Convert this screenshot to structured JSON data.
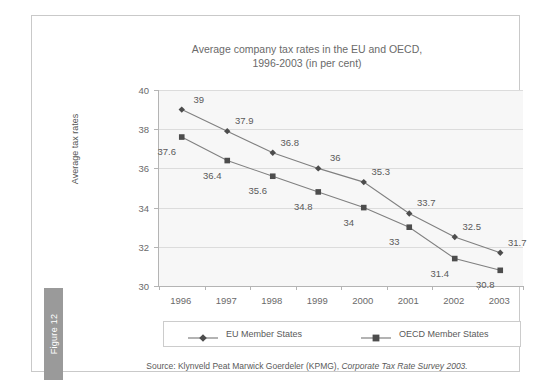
{
  "figure": {
    "tab_label": "Figure 12"
  },
  "source": {
    "prefix": "Source: Klynveld Peat Marwick Goerdeler (KPMG),",
    "italic": "Corporate Tax Rate Survey 2003."
  },
  "colors": {
    "line": "#808080",
    "marker": "#4d4d4d",
    "text": "#5a5a5a",
    "title_text": "#6a6a6a",
    "plot_background": "#f7f7f7",
    "gridline": "#dcdcdc",
    "axis": "#b4b4b4",
    "frame_border": "#c9c9c9",
    "tab_background": "#9a9a9a"
  },
  "chart_data": {
    "type": "line",
    "title": "Average company tax rates in the EU and OECD,",
    "subtitle": "1996-2003 (in per cent)",
    "xlabel": "",
    "ylabel": "Average tax rates",
    "categories": [
      "1996",
      "1997",
      "1998",
      "1999",
      "2000",
      "2001",
      "2002",
      "2003"
    ],
    "ylim": [
      30,
      40
    ],
    "yticks": [
      30,
      32,
      34,
      36,
      38,
      40
    ],
    "grid": true,
    "legend_position": "bottom",
    "series": [
      {
        "name": "EU Member States",
        "marker": "diamond",
        "values": [
          39,
          37.9,
          36.8,
          36,
          35.3,
          33.7,
          32.5,
          31.7
        ],
        "labels": [
          "39",
          "37.9",
          "36.8",
          "36",
          "35.3",
          "33.7",
          "32.5",
          "31.7"
        ]
      },
      {
        "name": "OECD Member States",
        "marker": "square",
        "values": [
          37.6,
          36.4,
          35.6,
          34.8,
          34,
          33,
          31.4,
          30.8
        ],
        "labels": [
          "37.6",
          "36.4",
          "35.6",
          "34.8",
          "34",
          "33",
          "31.4",
          "30.8"
        ]
      }
    ]
  }
}
